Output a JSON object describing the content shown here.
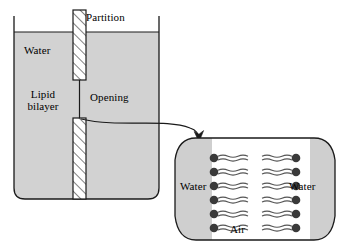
{
  "figure": {
    "type": "schematic-diagram"
  },
  "colors": {
    "water_fill": "#d2d2d2",
    "inset_water_fill": "#cfcfcf",
    "air_fill": "#ffffff",
    "outline": "#1a1a1a",
    "lipid_head": "#3a3a3a",
    "lipid_tail": "#555555",
    "hatch_fill": "#ffffff",
    "background": "#ffffff"
  },
  "tank": {
    "name": "water-tank",
    "water_label": "Water",
    "lipid_bilayer_label": "Lipid\nbilayer",
    "lipid_bilayer_line1": "Lipid",
    "lipid_bilayer_line2": "bilayer",
    "partition_label": "Partition",
    "opening_label": "Opening",
    "partition_hatching": "diagonal",
    "partition_segments": 2,
    "opening_height_px": 38
  },
  "inset": {
    "name": "bilayer-magnification",
    "water_label_left": "Water",
    "water_label_right": "Water",
    "air_label": "Air",
    "lipid_rows": 6,
    "leaflets": 2,
    "head_group": "circle",
    "tails_per_lipid": 2,
    "tail_style": "wavy",
    "shape": "rounded-rectangle"
  },
  "callout": {
    "name": "magnification-arrow",
    "style": "curved-arrow",
    "from": "opening",
    "to": "bilayer-magnification"
  }
}
